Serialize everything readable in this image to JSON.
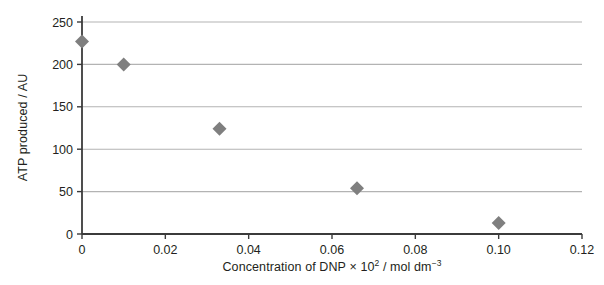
{
  "chart_data": {
    "type": "scatter",
    "title": "",
    "xlabel": "Concentration of DNP × 10² / mol dm⁻³",
    "xlabel_parts": {
      "before": "Concentration of DNP × 10",
      "exponent1": "2",
      "middle": " / mol dm",
      "exponent2": "−3"
    },
    "ylabel": "ATP produced / AU",
    "xlim": [
      0,
      0.12
    ],
    "ylim": [
      0,
      250
    ],
    "xticks": [
      0,
      0.02,
      0.04,
      0.06,
      0.08,
      0.1,
      0.12
    ],
    "xtick_labels": [
      "0",
      "0.02",
      "0.04",
      "0.06",
      "0.08",
      "0.10",
      "0.12"
    ],
    "yticks": [
      0,
      50,
      100,
      150,
      200,
      250
    ],
    "ytick_labels": [
      "0",
      "50",
      "100",
      "150",
      "200",
      "250"
    ],
    "grid": "horizontal",
    "legend": "none",
    "marker": "diamond",
    "marker_color": "#7f7f7f",
    "grid_color": "#b3b3b3",
    "axis_color": "#3b3b3b",
    "x": [
      0,
      0.01,
      0.033,
      0.066,
      0.1
    ],
    "y": [
      227,
      200,
      124,
      54,
      13
    ],
    "points": [
      {
        "x": 0,
        "y": 227
      },
      {
        "x": 0.01,
        "y": 200
      },
      {
        "x": 0.033,
        "y": 124
      },
      {
        "x": 0.066,
        "y": 54
      },
      {
        "x": 0.1,
        "y": 13
      }
    ]
  }
}
